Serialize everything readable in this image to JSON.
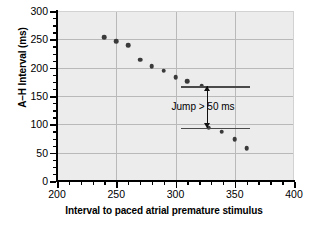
{
  "chart_data": {
    "type": "scatter",
    "title": "",
    "xlabel": "Interval to paced atrial premature stimulus",
    "ylabel": "A–H Interval (ms)",
    "xlim": [
      200,
      400
    ],
    "ylim": [
      0,
      300
    ],
    "xticks": [
      200,
      250,
      300,
      350,
      400
    ],
    "xtick_labels": [
      "200",
      "250",
      "300",
      "350",
      "400"
    ],
    "yticks": [
      0,
      50,
      100,
      150,
      200,
      250,
      300
    ],
    "ytick_labels": [
      "0",
      "50",
      "100",
      "150",
      "200",
      "250",
      "300"
    ],
    "grid": true,
    "legend": "none",
    "series": [
      {
        "name": "A-H interval response",
        "marker": "filled-circle",
        "color": "#3a3a3a",
        "points": [
          {
            "x": 240,
            "y": 254
          },
          {
            "x": 250,
            "y": 247
          },
          {
            "x": 260,
            "y": 240
          },
          {
            "x": 270,
            "y": 214
          },
          {
            "x": 280,
            "y": 203
          },
          {
            "x": 290,
            "y": 195
          },
          {
            "x": 300,
            "y": 183
          },
          {
            "x": 310,
            "y": 176
          },
          {
            "x": 322,
            "y": 168
          },
          {
            "x": 328,
            "y": 94
          },
          {
            "x": 339,
            "y": 87
          },
          {
            "x": 350,
            "y": 74
          },
          {
            "x": 360,
            "y": 58
          }
        ]
      }
    ],
    "annotations": [
      {
        "kind": "hline",
        "name": "upper-reference-line",
        "y": 167,
        "x_start": 305,
        "x_end": 363,
        "color": "#4a4a4a"
      },
      {
        "kind": "hline",
        "name": "lower-reference-line",
        "y": 94,
        "x_start": 305,
        "x_end": 363,
        "color": "#4a4a4a"
      },
      {
        "kind": "double-arrow",
        "name": "jump-arrow",
        "x": 327,
        "y_top": 167,
        "y_bottom": 94,
        "color": "#111111"
      },
      {
        "kind": "text",
        "name": "jump-annotation",
        "text": "Jump > 50 ms",
        "x": 327,
        "y": 130
      }
    ]
  },
  "axes": {
    "x_title": "Interval to paced atrial premature stimulus",
    "y_title": "A–H Interval (ms)",
    "x_tick_labels": [
      "200",
      "250",
      "300",
      "350",
      "400"
    ],
    "y_tick_labels": [
      "300",
      "250",
      "200",
      "150",
      "100",
      "50",
      "0"
    ]
  },
  "annotation_text": {
    "jump": "Jump > 50 ms"
  },
  "colors": {
    "plot_background": "#ececec",
    "gridline": "#b9b9b9",
    "marker": "#3a3a3a",
    "reference_line": "#4a4a4a",
    "arrow": "#111111",
    "axis": "#000000"
  }
}
